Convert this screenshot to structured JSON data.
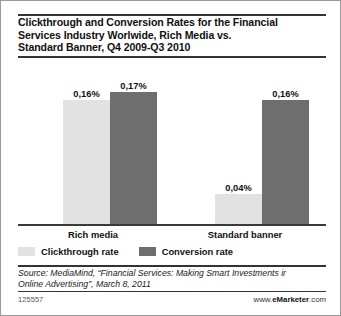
{
  "title": {
    "line1": "Clickthrough and Conversion Rates for the Financial",
    "line2": "Services Industry Worlwide, Rich Media vs.",
    "line3": "Standard Banner, Q4 2009-Q3 2010"
  },
  "chart_data": {
    "type": "bar",
    "title": "Clickthrough and Conversion Rates for the Financial Services Industry Worlwide, Rich Media vs. Standard Banner, Q4 2009-Q3 2010",
    "xlabel": "",
    "ylabel": "",
    "unit": "%",
    "decimal_separator": ",",
    "grid": false,
    "axis_visible": "x-baseline-only",
    "ylim": [
      0,
      0.17
    ],
    "legend_position": "bottom-left",
    "categories": [
      "Rich media",
      "Standard banner"
    ],
    "series": [
      {
        "name": "Clickthrough rate",
        "color": "#e2e2e2",
        "values": [
          0.16,
          0.04
        ],
        "labels": [
          "0,16%",
          "0,04%"
        ]
      },
      {
        "name": "Conversion rate",
        "color": "#6e6e6e",
        "values": [
          0.17,
          0.16
        ],
        "labels": [
          "0,17%",
          "0,16%"
        ]
      }
    ]
  },
  "source": {
    "line1": "Source: MediaMind, “Financial Services: Making Smart Investments ir",
    "line2": "Online Advertising”, March 8, 2011"
  },
  "footer": {
    "chart_id": "125557",
    "brand_prefix": "www.",
    "brand": "eMarketer",
    "brand_suffix": ".com"
  }
}
